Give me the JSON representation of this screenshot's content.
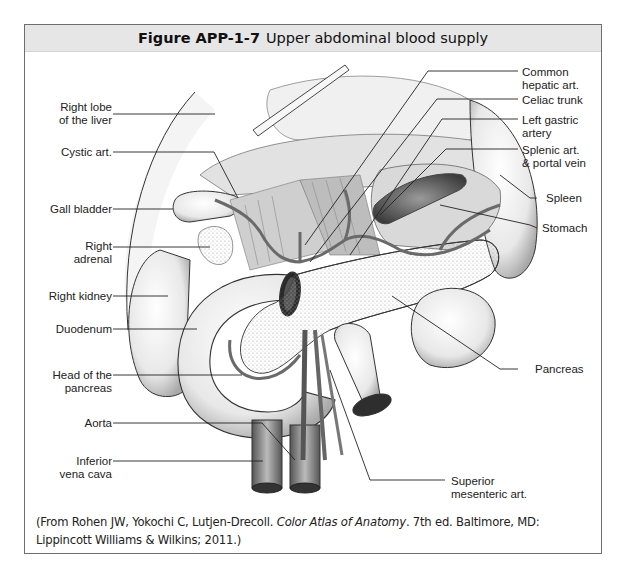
{
  "figure": {
    "number": "Figure APP-1-7",
    "title": "Upper abdominal blood supply"
  },
  "labels_left": [
    {
      "id": "right-lobe-liver",
      "line1": "Right lobe",
      "line2": "of the liver"
    },
    {
      "id": "cystic-art",
      "line1": "Cystic art.",
      "line2": ""
    },
    {
      "id": "gall-bladder",
      "line1": "Gall bladder",
      "line2": ""
    },
    {
      "id": "right-adrenal",
      "line1": "Right",
      "line2": "adrenal"
    },
    {
      "id": "right-kidney",
      "line1": "Right kidney",
      "line2": ""
    },
    {
      "id": "duodenum",
      "line1": "Duodenum",
      "line2": ""
    },
    {
      "id": "head-of-pancreas",
      "line1": "Head of the",
      "line2": "pancreas"
    },
    {
      "id": "aorta",
      "line1": "Aorta",
      "line2": ""
    },
    {
      "id": "inferior-vena-cava",
      "line1": "Inferior",
      "line2": "vena cava"
    }
  ],
  "labels_right": [
    {
      "id": "common-hepatic-art",
      "line1": "Common",
      "line2": "hepatic art."
    },
    {
      "id": "celiac-trunk",
      "line1": "Celiac trunk",
      "line2": ""
    },
    {
      "id": "left-gastric-artery",
      "line1": "Left gastric",
      "line2": "artery"
    },
    {
      "id": "splenic-art-portal-vein",
      "line1": "Splenic art.",
      "line2": "& portal vein"
    },
    {
      "id": "spleen",
      "line1": "Spleen",
      "line2": ""
    },
    {
      "id": "stomach",
      "line1": "Stomach",
      "line2": ""
    },
    {
      "id": "pancreas",
      "line1": "Pancreas",
      "line2": ""
    },
    {
      "id": "superior-mesenteric-art",
      "line1": "Superior",
      "line2": "mesenteric art."
    }
  ],
  "caption": {
    "prefix": "(From Rohen JW, Yokochi C, Lutjen-Drecoll. ",
    "book_title": "Color Atlas of Anatomy",
    "suffix": ". 7th ed. Baltimore, MD: Lippincott Williams & Wilkins; 2011.)"
  },
  "colors": {
    "frame_border": "#6e6e6e",
    "header_bg": "#e6e6e6",
    "ink": "#222222"
  }
}
